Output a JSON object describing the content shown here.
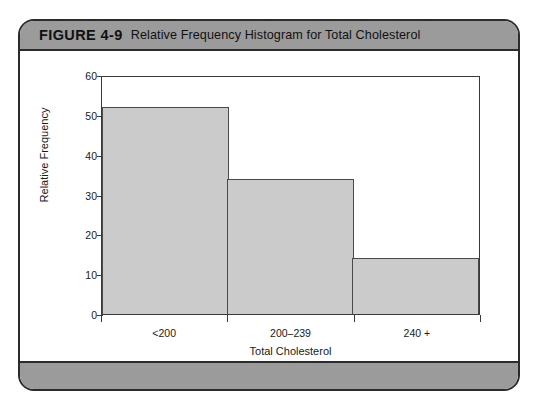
{
  "figure": {
    "number_label": "FIGURE 4-9",
    "title": "Relative Frequency Histogram for Total Cholesterol"
  },
  "colors": {
    "band": "#9b9b9b",
    "card_border": "#2b2b2b",
    "bar_fill": "#cbcbcb",
    "bar_edge": "#4a4a4a",
    "axis": "#3a3a3a"
  },
  "chart_data": {
    "type": "bar",
    "title": "Relative Frequency Histogram for Total Cholesterol",
    "subtitle": "",
    "categories": [
      "<200",
      "200–239",
      "240 +"
    ],
    "values": [
      52,
      34,
      14
    ],
    "xlabel": "Total Cholesterol",
    "ylabel": "Relative Frequency",
    "ylim": [
      0,
      60
    ],
    "ytick_values": [
      0,
      10,
      20,
      30,
      40,
      50,
      60
    ],
    "ytick_labels": [
      "0",
      "10",
      "20",
      "30",
      "40",
      "50",
      "60"
    ],
    "grid": false,
    "legend": false
  }
}
